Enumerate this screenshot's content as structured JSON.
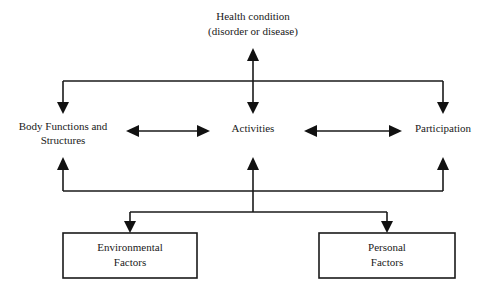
{
  "diagram": {
    "type": "ICF framework flow diagram",
    "nodes": {
      "health_condition": {
        "line1": "Health condition",
        "line2": "(disorder or disease)"
      },
      "body_functions": {
        "line1": "Body Functions and",
        "line2": "Structures"
      },
      "activities": {
        "label": "Activities"
      },
      "participation": {
        "label": "Participation"
      },
      "environmental_factors": {
        "line1": "Environmental",
        "line2": "Factors"
      },
      "personal_factors": {
        "line1": "Personal",
        "line2": "Factors"
      }
    },
    "edges": [
      {
        "from": "Health condition",
        "to": "Activities",
        "style": "bidirectional"
      },
      {
        "from": "Health condition",
        "to": "Body Functions and Structures",
        "style": "directed"
      },
      {
        "from": "Health condition",
        "to": "Participation",
        "style": "directed"
      },
      {
        "from": "Body Functions and Structures",
        "to": "Activities",
        "style": "bidirectional"
      },
      {
        "from": "Activities",
        "to": "Participation",
        "style": "bidirectional"
      },
      {
        "from": "Contextual factors bus",
        "to": "Body Functions and Structures",
        "style": "directed"
      },
      {
        "from": "Contextual factors bus",
        "to": "Activities",
        "style": "directed"
      },
      {
        "from": "Contextual factors bus",
        "to": "Participation",
        "style": "directed"
      },
      {
        "from": "Contextual factors bus",
        "to": "Environmental Factors",
        "style": "directed"
      },
      {
        "from": "Contextual factors bus",
        "to": "Personal Factors",
        "style": "directed"
      }
    ],
    "colors": {
      "stroke": "#1a1a1a",
      "background": "#ffffff"
    }
  }
}
